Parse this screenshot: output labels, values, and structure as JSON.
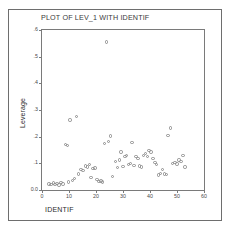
{
  "window": {
    "background": "#ffffff",
    "frame_color": "#6e6e6e"
  },
  "chart_data": {
    "type": "scatter",
    "title": "PLOT OF LEV_1 WITH IDENTIF",
    "xlabel": "IDENTIF",
    "ylabel": "Leverage",
    "xlim": [
      0,
      60
    ],
    "ylim": [
      0.0,
      0.6
    ],
    "xticks": [
      0,
      10,
      20,
      30,
      40,
      50,
      60
    ],
    "xtick_labels": [
      "0",
      "10",
      "20",
      "30",
      "40",
      "50",
      "60"
    ],
    "yticks": [
      0.0,
      0.1,
      0.2,
      0.3,
      0.4,
      0.5,
      0.6
    ],
    "ytick_labels": [
      "0.0",
      ".1",
      ".2",
      ".3",
      ".4",
      ".5",
      ".6"
    ],
    "grid": false,
    "legend": false,
    "marker": "open-circle",
    "marker_color": "#8d8d8d",
    "series": [
      {
        "name": "LEV_1",
        "points": [
          [
            2.6,
            0.022
          ],
          [
            3.4,
            0.02
          ],
          [
            4.2,
            0.026
          ],
          [
            4.8,
            0.021
          ],
          [
            5.6,
            0.024
          ],
          [
            6.3,
            0.019
          ],
          [
            7.1,
            0.027
          ],
          [
            7.8,
            0.022
          ],
          [
            8.6,
            0.17
          ],
          [
            9.4,
            0.168
          ],
          [
            9.8,
            0.03
          ],
          [
            10.4,
            0.262
          ],
          [
            11.2,
            0.036
          ],
          [
            12.0,
            0.044
          ],
          [
            12.8,
            0.275
          ],
          [
            13.6,
            0.06
          ],
          [
            14.4,
            0.078
          ],
          [
            15.2,
            0.072
          ],
          [
            16.0,
            0.09
          ],
          [
            16.8,
            0.086
          ],
          [
            17.6,
            0.095
          ],
          [
            18.2,
            0.046
          ],
          [
            18.9,
            0.08
          ],
          [
            19.6,
            0.082
          ],
          [
            20.3,
            0.04
          ],
          [
            21.1,
            0.032
          ],
          [
            21.8,
            0.034
          ],
          [
            22.4,
            0.03
          ],
          [
            23.2,
            0.175
          ],
          [
            23.9,
            0.555
          ],
          [
            24.6,
            0.181
          ],
          [
            25.3,
            0.203
          ],
          [
            26.0,
            0.05
          ],
          [
            27.2,
            0.108
          ],
          [
            27.9,
            0.084
          ],
          [
            28.6,
            0.112
          ],
          [
            29.3,
            0.142
          ],
          [
            30.0,
            0.088
          ],
          [
            30.7,
            0.126
          ],
          [
            31.4,
            0.13
          ],
          [
            32.1,
            0.096
          ],
          [
            32.8,
            0.1
          ],
          [
            33.4,
            0.178
          ],
          [
            34.1,
            0.092
          ],
          [
            34.8,
            0.126
          ],
          [
            35.5,
            0.118
          ],
          [
            36.2,
            0.09
          ],
          [
            36.9,
            0.086
          ],
          [
            37.6,
            0.13
          ],
          [
            38.3,
            0.138
          ],
          [
            39.0,
            0.126
          ],
          [
            39.7,
            0.148
          ],
          [
            40.4,
            0.142
          ],
          [
            41.1,
            0.118
          ],
          [
            41.8,
            0.104
          ],
          [
            42.5,
            0.096
          ],
          [
            43.2,
            0.056
          ],
          [
            43.9,
            0.062
          ],
          [
            44.6,
            0.076
          ],
          [
            45.3,
            0.06
          ],
          [
            46.0,
            0.058
          ],
          [
            46.7,
            0.205
          ],
          [
            47.5,
            0.232
          ],
          [
            48.4,
            0.1
          ],
          [
            49.2,
            0.104
          ],
          [
            50.0,
            0.098
          ],
          [
            50.8,
            0.112
          ],
          [
            51.5,
            0.108
          ],
          [
            52.2,
            0.13
          ],
          [
            53.0,
            0.086
          ]
        ]
      }
    ]
  }
}
